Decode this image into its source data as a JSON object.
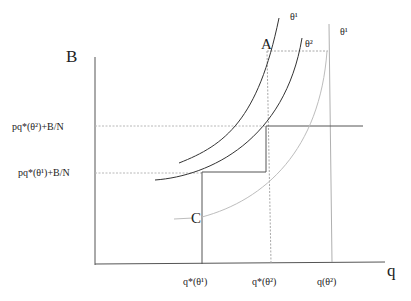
{
  "diagram": {
    "type": "economic-indifference-diagram",
    "axes": {
      "y_label": "B",
      "x_label": "q"
    },
    "y_ticks": [
      {
        "id": "theta2_level",
        "label": "pq*(θ²)+B/N",
        "y": 126
      },
      {
        "id": "theta1_level",
        "label": "pq*(θ¹)+B/N",
        "y": 173
      }
    ],
    "x_ticks": [
      {
        "id": "qstar_theta1",
        "label": "q*(θ¹)",
        "x": 202
      },
      {
        "id": "qstar_theta2",
        "label": "q*(θ²)",
        "x": 267
      },
      {
        "id": "q_theta2",
        "label": "q(θ²)",
        "x": 331
      }
    ],
    "points": [
      {
        "id": "A",
        "label": "A"
      },
      {
        "id": "C",
        "label": "C"
      }
    ],
    "curves": [
      {
        "id": "curve_theta1_dark",
        "label": "θ¹",
        "color": "#333333"
      },
      {
        "id": "curve_theta2_dark",
        "label": "θ²",
        "color": "#333333"
      },
      {
        "id": "curve_theta1_light",
        "label": "θ¹",
        "color": "#b5b5b5"
      }
    ],
    "colors": {
      "axis": "#444444",
      "solid_line": "#444444",
      "dashed_line": "#b0b0b0",
      "light_curve": "#b5b5b5",
      "text": "#222222"
    }
  }
}
